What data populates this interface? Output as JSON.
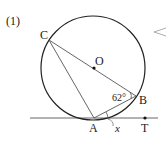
{
  "problem": {
    "number_label": "(1)"
  },
  "diagram": {
    "points": {
      "C": {
        "label": "C",
        "x": 49,
        "y": 40
      },
      "O": {
        "label": "O",
        "x": 94,
        "y": 68
      },
      "B": {
        "label": "B",
        "x": 136,
        "y": 96
      },
      "A": {
        "label": "A",
        "x": 94,
        "y": 118
      },
      "T": {
        "label": "T",
        "x": 145,
        "y": 118
      }
    },
    "circle": {
      "cx": 93,
      "cy": 68,
      "r": 52
    },
    "angle_label": "62°",
    "unknown_label": "x",
    "colors": {
      "line": "#555555",
      "circle": "#222222",
      "text": "#222222"
    }
  }
}
